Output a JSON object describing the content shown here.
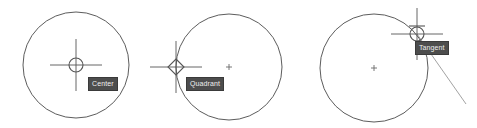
{
  "canvas": {
    "width": 477,
    "height": 128,
    "background": "#ffffff",
    "line_color": "#4a4a4a",
    "marker_color": "#555555",
    "tooltip_bg": "#4d4d4d",
    "tooltip_text_color": "#efefef",
    "tooltip_border": "#3a3a3a"
  },
  "figures": [
    {
      "id": "center-snap",
      "label": "Center",
      "snap_mode": "center",
      "marker_icon": "circle-snap-marker",
      "circle": {
        "cx": 76,
        "cy": 65,
        "r": 53
      },
      "snap_point": {
        "x": 76,
        "y": 65
      },
      "crosshair": {
        "x": 76,
        "y": 65,
        "size": 26
      }
    },
    {
      "id": "quadrant-snap",
      "label": "Quadrant",
      "snap_mode": "quadrant",
      "marker_icon": "diamond-snap-marker",
      "circle": {
        "cx": 229,
        "cy": 67,
        "r": 53
      },
      "snap_point": {
        "x": 176,
        "y": 67
      },
      "crosshair": {
        "x": 176,
        "y": 67,
        "size": 26
      },
      "center_mark": {
        "x": 229,
        "y": 67
      }
    },
    {
      "id": "tangent-snap",
      "label": "Tangent",
      "snap_mode": "tangent",
      "marker_icon": "tangent-snap-marker",
      "circle": {
        "cx": 374,
        "cy": 68,
        "r": 54
      },
      "snap_point": {
        "x": 417,
        "y": 34
      },
      "crosshair": {
        "x": 417,
        "y": 34,
        "size": 26
      },
      "center_mark": {
        "x": 374,
        "y": 68
      },
      "tangent_line": {
        "x1": 417,
        "y1": 34,
        "x2": 466,
        "y2": 104
      }
    }
  ]
}
